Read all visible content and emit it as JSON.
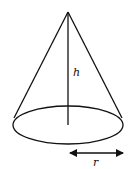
{
  "diagram": {
    "type": "cone",
    "labels": {
      "height": "h",
      "radius": "r"
    },
    "colors": {
      "stroke": "#111111",
      "background": "#ffffff"
    }
  }
}
